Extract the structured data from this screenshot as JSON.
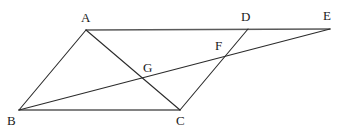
{
  "figure": {
    "width": 338,
    "height": 136,
    "background_color": "#ffffff",
    "line_color": "#2b2b2b",
    "horizontal_line_color": "#5a5a5a",
    "label_color": "#1a1a1a",
    "stroke_width": 1.1
  },
  "points": {
    "A": {
      "label": "A",
      "x": 86,
      "y": 30,
      "label_x": 81,
      "label_y": 11
    },
    "B": {
      "label": "B",
      "x": 19,
      "y": 110,
      "label_x": 7,
      "label_y": 114
    },
    "C": {
      "label": "C",
      "x": 180,
      "y": 110,
      "label_x": 176,
      "label_y": 114
    },
    "D": {
      "label": "D",
      "x": 248,
      "y": 29,
      "label_x": 241,
      "label_y": 10
    },
    "E": {
      "label": "E",
      "x": 330,
      "y": 29,
      "label_x": 323,
      "label_y": 9
    },
    "F": {
      "label": "F",
      "x": 228,
      "y": 54,
      "label_x": 215,
      "label_y": 39
    },
    "G": {
      "label": "G",
      "x": 145,
      "y": 79,
      "label_x": 143,
      "label_y": 61
    }
  },
  "segments": [
    {
      "name": "segment-AE",
      "from": "A",
      "to": "E",
      "kind": "horizontal-top"
    },
    {
      "name": "segment-BC",
      "from": "B",
      "to": "C",
      "kind": "horizontal-bottom"
    },
    {
      "name": "segment-AB",
      "from": "A",
      "to": "B",
      "kind": "diagonal"
    },
    {
      "name": "segment-AC",
      "from": "A",
      "to": "C",
      "kind": "diagonal"
    },
    {
      "name": "segment-CD",
      "from": "C",
      "to": "D",
      "kind": "diagonal"
    },
    {
      "name": "segment-BE",
      "from": "B",
      "to": "E",
      "kind": "diagonal"
    }
  ],
  "labels_order": [
    "A",
    "D",
    "E",
    "F",
    "G",
    "B",
    "C"
  ]
}
